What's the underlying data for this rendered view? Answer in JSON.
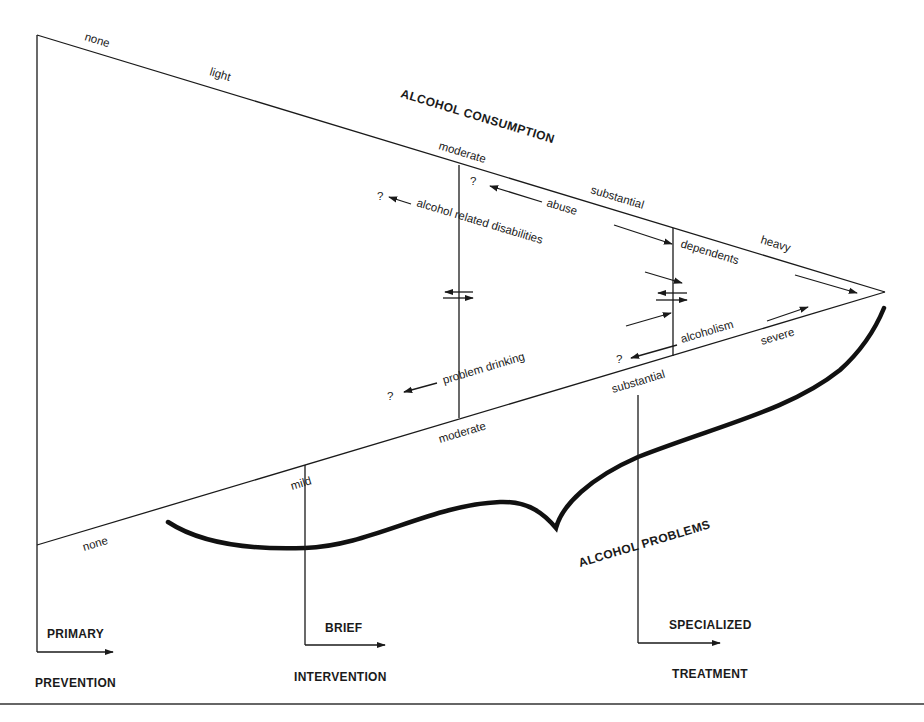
{
  "diagram": {
    "title_top": "ALCOHOL CONSUMPTION",
    "title_bottom": "ALCOHOL PROBLEMS",
    "consumption_levels": [
      "none",
      "light",
      "moderate",
      "substantial",
      "heavy"
    ],
    "problem_levels": [
      "none",
      "mild",
      "moderate",
      "substantial",
      "severe"
    ],
    "inner_labels": {
      "abuse": "abuse",
      "alcohol_related_disabilities": "alcohol related disabilities",
      "dependents": "dependents",
      "problem_drinking": "problem drinking",
      "alcoholism": "alcoholism",
      "question": "?"
    },
    "interventions": [
      {
        "top": "PRIMARY",
        "bottom": "PREVENTION"
      },
      {
        "top": "BRIEF",
        "bottom": "INTERVENTION"
      },
      {
        "top": "SPECIALIZED",
        "bottom": "TREATMENT"
      }
    ]
  }
}
